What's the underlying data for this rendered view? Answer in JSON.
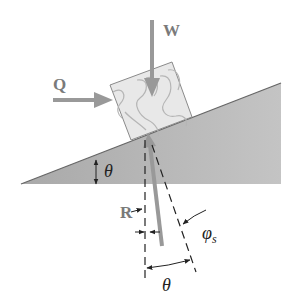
{
  "diagram": {
    "colors": {
      "incline_fill": "#b8b8b8",
      "incline_edge": "#666666",
      "block_fill": "#e6e6e6",
      "block_edge": "#8a8a8a",
      "force_arrow": "#999999",
      "dimension_line": "#222222",
      "force_label": "#7a7a7a",
      "angle_label": "#222222"
    },
    "labels": {
      "weight": "W",
      "applied_force": "Q",
      "reaction": "R",
      "incline_angle": "θ",
      "friction_angle_symbol": "φ",
      "friction_angle_subscript": "s",
      "bottom_angle": "θ"
    },
    "elements": [
      {
        "id": "incline",
        "type": "wedge",
        "description": "inclined plane rising to the right"
      },
      {
        "id": "block",
        "type": "wooden block",
        "description": "block resting on incline with wood grain"
      },
      {
        "id": "W",
        "type": "force",
        "direction": "downward"
      },
      {
        "id": "Q",
        "type": "force",
        "direction": "horizontal right, pushing block"
      },
      {
        "id": "R",
        "type": "force",
        "direction": "upward from below plane, tilted by φs from normal"
      },
      {
        "id": "theta_incline",
        "type": "angle",
        "between": "incline surface and horizontal"
      },
      {
        "id": "phi_s",
        "type": "angle",
        "between": "R and normal to incline"
      },
      {
        "id": "theta_bottom",
        "type": "angle",
        "between": "vertical and normal to incline"
      }
    ]
  }
}
